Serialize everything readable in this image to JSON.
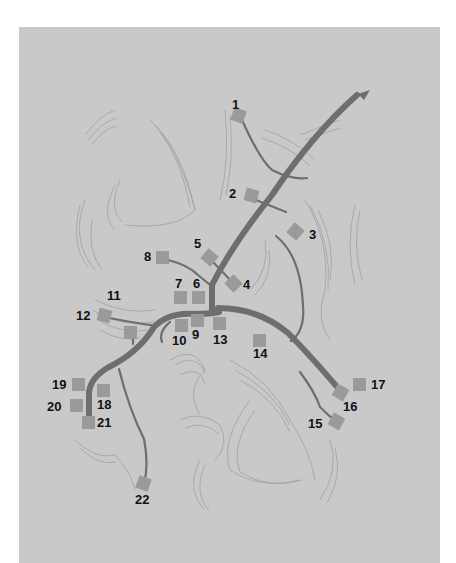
{
  "map": {
    "background": "#c9c9c9",
    "road_color": "#6e6e6e",
    "marker_color": "#9a9a9a",
    "direction_arrow": "arrow-northeast-icon",
    "markers": [
      {
        "id": "1",
        "label": "1",
        "x": 238,
        "y": 115,
        "lx": 232,
        "ly": 98,
        "rot": 20
      },
      {
        "id": "2",
        "label": "2",
        "x": 251,
        "y": 195,
        "lx": 229,
        "ly": 187,
        "rot": 15
      },
      {
        "id": "3",
        "label": "3",
        "x": 295,
        "y": 231,
        "lx": 309,
        "ly": 228,
        "rot": 40
      },
      {
        "id": "4",
        "label": "4",
        "x": 233,
        "y": 283,
        "lx": 243,
        "ly": 278,
        "rot": 45
      },
      {
        "id": "5",
        "label": "5",
        "x": 209,
        "y": 257,
        "lx": 194,
        "ly": 237,
        "rot": 40
      },
      {
        "id": "6",
        "label": "6",
        "x": 198,
        "y": 297,
        "lx": 193,
        "ly": 277,
        "rot": 0
      },
      {
        "id": "7",
        "label": "7",
        "x": 180,
        "y": 297,
        "lx": 175,
        "ly": 277,
        "rot": 0
      },
      {
        "id": "8",
        "label": "8",
        "x": 162,
        "y": 257,
        "lx": 144,
        "ly": 250,
        "rot": 0
      },
      {
        "id": "9",
        "label": "9",
        "x": 197,
        "y": 320,
        "lx": 192,
        "ly": 328,
        "rot": 0
      },
      {
        "id": "10",
        "label": "10",
        "x": 181,
        "y": 325,
        "lx": 172,
        "ly": 334,
        "rot": 0
      },
      {
        "id": "11",
        "label": "11",
        "x": 130,
        "y": 332,
        "lx": 107,
        "ly": 289,
        "rot": 0
      },
      {
        "id": "12",
        "label": "12",
        "x": 104,
        "y": 315,
        "lx": 76,
        "ly": 309,
        "rot": 15
      },
      {
        "id": "13",
        "label": "13",
        "x": 219,
        "y": 323,
        "lx": 213,
        "ly": 333,
        "rot": 0
      },
      {
        "id": "14",
        "label": "14",
        "x": 259,
        "y": 340,
        "lx": 253,
        "ly": 347,
        "rot": 0
      },
      {
        "id": "15",
        "label": "15",
        "x": 336,
        "y": 421,
        "lx": 308,
        "ly": 417,
        "rot": 30
      },
      {
        "id": "16",
        "label": "16",
        "x": 340,
        "y": 392,
        "lx": 343,
        "ly": 400,
        "rot": 30
      },
      {
        "id": "17",
        "label": "17",
        "x": 359,
        "y": 384,
        "lx": 371,
        "ly": 378,
        "rot": 0
      },
      {
        "id": "18",
        "label": "18",
        "x": 103,
        "y": 390,
        "lx": 97,
        "ly": 398,
        "rot": 0
      },
      {
        "id": "19",
        "label": "19",
        "x": 78,
        "y": 384,
        "lx": 52,
        "ly": 378,
        "rot": 0
      },
      {
        "id": "20",
        "label": "20",
        "x": 76,
        "y": 405,
        "lx": 47,
        "ly": 400,
        "rot": 0
      },
      {
        "id": "21",
        "label": "21",
        "x": 88,
        "y": 422,
        "lx": 97,
        "ly": 416,
        "rot": 0
      },
      {
        "id": "22",
        "label": "22",
        "x": 143,
        "y": 483,
        "lx": 135,
        "ly": 493,
        "rot": 20
      }
    ]
  }
}
